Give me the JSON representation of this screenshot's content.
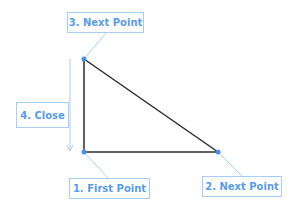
{
  "diagram": {
    "colors": {
      "edge": "#2b2b2b",
      "annotation": "#5b9bdf",
      "label_border": "#a9cdf0",
      "point": "#4a90e2"
    },
    "points": [
      {
        "id": 1,
        "x": 84,
        "y": 152
      },
      {
        "id": 2,
        "x": 218,
        "y": 152
      },
      {
        "id": 3,
        "x": 84,
        "y": 59
      }
    ],
    "labels": {
      "first_point": "1. First Point",
      "next_point_2": "2. Next Point",
      "next_point_3": "3. Next Point",
      "close": "4. Close"
    }
  }
}
